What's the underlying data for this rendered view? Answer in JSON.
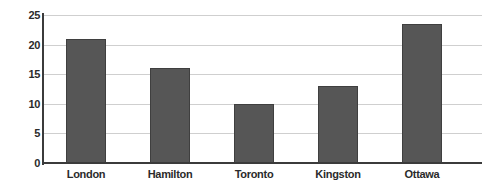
{
  "chart_data": {
    "type": "bar",
    "title": "",
    "subtitle": "",
    "xlabel": "",
    "ylabel": "",
    "categories": [
      "London",
      "Hamilton",
      "Toronto",
      "Kingston",
      "Ottawa"
    ],
    "values": [
      21,
      16,
      10,
      13,
      23.5
    ],
    "ylim": [
      0,
      25
    ],
    "yticks": [
      0,
      5,
      10,
      15,
      20,
      25
    ],
    "ytick_labels": [
      "0",
      "5",
      "10",
      "15",
      "20",
      "25"
    ],
    "grid": true,
    "grid_axis": "y",
    "legend": false,
    "legend_position": "none",
    "bar_color": "#565656",
    "bar_border_color": "#3f3f3f",
    "gridline_color": "#cfcfcf",
    "axis_color": "#3b3b3b",
    "background_color": "#ffffff",
    "text_color": "#2b2b2b"
  }
}
